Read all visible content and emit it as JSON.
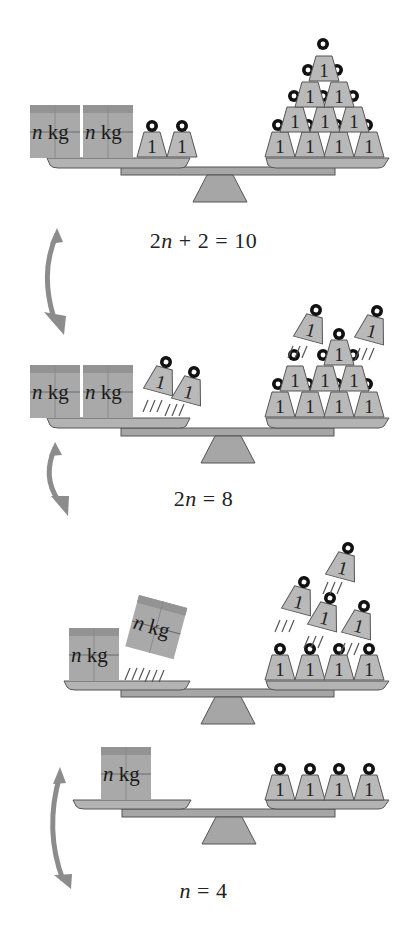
{
  "diagram": {
    "type": "balance-scale-equation-solving",
    "colors": {
      "metal": "#b9b9b9",
      "outline": "#555555",
      "box": "#a9a9a9",
      "box_top": "#8f8f8f",
      "arrow": "#8c8c8c",
      "ring": "#111111",
      "text": "#222222"
    },
    "unknown_box_label": {
      "var": "n",
      "unit": "kg"
    },
    "unit_weight_label": "1",
    "steps": [
      {
        "equation": {
          "left": "2n + 2",
          "rel": "=",
          "right": "10",
          "display": "2n + 2 = 10"
        },
        "left_pan": {
          "boxes": 2,
          "weights": 2
        },
        "right_pan": {
          "weights": 10,
          "arrangement": "pyramid 4-3-2-1"
        }
      },
      {
        "equation": {
          "left": "2n",
          "rel": "=",
          "right": "8",
          "display": "2n = 8"
        },
        "left_pan": {
          "boxes": 2,
          "weights_removed": 2
        },
        "right_pan": {
          "weights": 8,
          "weights_removed": 2
        },
        "arrow": "subtract 2 from both sides"
      },
      {
        "left_pan": {
          "boxes": 1,
          "boxes_removed": 1
        },
        "right_pan": {
          "weights": 4,
          "weights_removed": 4
        },
        "arrow": "divide both sides by 2"
      },
      {
        "equation": {
          "left": "n",
          "rel": "=",
          "right": "4",
          "display": "n = 4"
        },
        "left_pan": {
          "boxes": 1
        },
        "right_pan": {
          "weights": 4
        }
      }
    ]
  },
  "eq1": {
    "a": "2",
    "v": "n",
    "b": "+ 2 = 10"
  },
  "eq2": {
    "a": "2",
    "v": "n",
    "b": "= 8"
  },
  "eq3": {
    "a": "",
    "v": "n",
    "b": "= 4"
  },
  "labels": {
    "n": "n",
    "kg": "kg",
    "one": "1"
  }
}
